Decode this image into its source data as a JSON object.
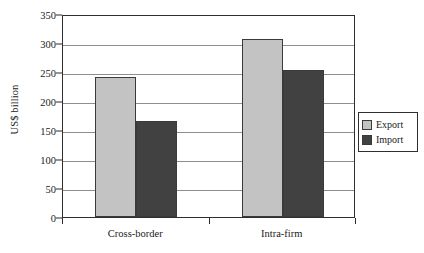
{
  "chart_data": {
    "type": "bar",
    "title": "",
    "subtitle": "",
    "xlabel": "",
    "ylabel": "US$ billion",
    "categories": [
      "Cross-border",
      "Intra-firm"
    ],
    "series": [
      {
        "name": "Export",
        "values": [
          242,
          307
        ],
        "color": "#c3c3c3"
      },
      {
        "name": "Import",
        "values": [
          166,
          253
        ],
        "color": "#414141"
      }
    ],
    "ylim": [
      0,
      350
    ],
    "ytick_step": 50,
    "yticks": [
      0,
      50,
      100,
      150,
      200,
      250,
      300,
      350
    ],
    "ytick_labels": [
      "0",
      "50",
      "100",
      "150",
      "200",
      "250",
      "300",
      "350"
    ],
    "grid": true,
    "grid_axis": "y",
    "legend_position": "right",
    "legend_entries": [
      "Export",
      "Import"
    ],
    "annotations": []
  },
  "axes": {
    "y_title": "US$ billion"
  },
  "legend": {
    "items": [
      {
        "label": "Export",
        "swatch": "legend-swatch-export"
      },
      {
        "label": "Import",
        "swatch": "legend-swatch-import"
      }
    ]
  }
}
